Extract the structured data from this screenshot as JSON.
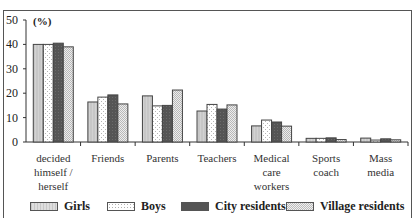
{
  "chart_data": {
    "type": "bar",
    "title": "",
    "ylabel": "(%)",
    "xlabel": "",
    "ylim": [
      0,
      50
    ],
    "yticks": [
      0,
      10,
      20,
      30,
      40,
      50
    ],
    "grid": false,
    "legend_position": "bottom",
    "categories": [
      "decided himself / herself",
      "Friends",
      "Parents",
      "Teachers",
      "Medical care workers",
      "Sports coach",
      "Mass media"
    ],
    "category_lines": [
      [
        "decided",
        "himself /",
        "herself"
      ],
      [
        "Friends"
      ],
      [
        "Parents"
      ],
      [
        "Teachers"
      ],
      [
        "Medical",
        "care",
        "workers"
      ],
      [
        "Sports",
        "coach"
      ],
      [
        "Mass",
        "media"
      ]
    ],
    "series": [
      {
        "name": "Girls",
        "values": [
          40.0,
          16.4,
          18.9,
          12.7,
          6.6,
          1.5,
          1.6
        ],
        "fill": "#cfcfcf",
        "pattern": "vlines"
      },
      {
        "name": "Boys",
        "values": [
          40.0,
          18.4,
          14.8,
          15.4,
          9.0,
          1.5,
          0.8
        ],
        "fill": "#ffffff",
        "pattern": "dots"
      },
      {
        "name": "City residents",
        "values": [
          40.5,
          19.3,
          15.0,
          13.5,
          8.2,
          1.7,
          1.3
        ],
        "fill": "#555555",
        "pattern": "dark"
      },
      {
        "name": "Village residents",
        "values": [
          39.0,
          15.6,
          21.3,
          15.2,
          6.5,
          1.0,
          0.9
        ],
        "fill": "#e6e6e6",
        "pattern": "checker"
      }
    ]
  },
  "legend": {
    "items": [
      {
        "label": "Girls"
      },
      {
        "label": "Boys"
      },
      {
        "label": "City residents"
      },
      {
        "label": "Village residents"
      }
    ]
  },
  "axis": {
    "unit": "(%)"
  }
}
